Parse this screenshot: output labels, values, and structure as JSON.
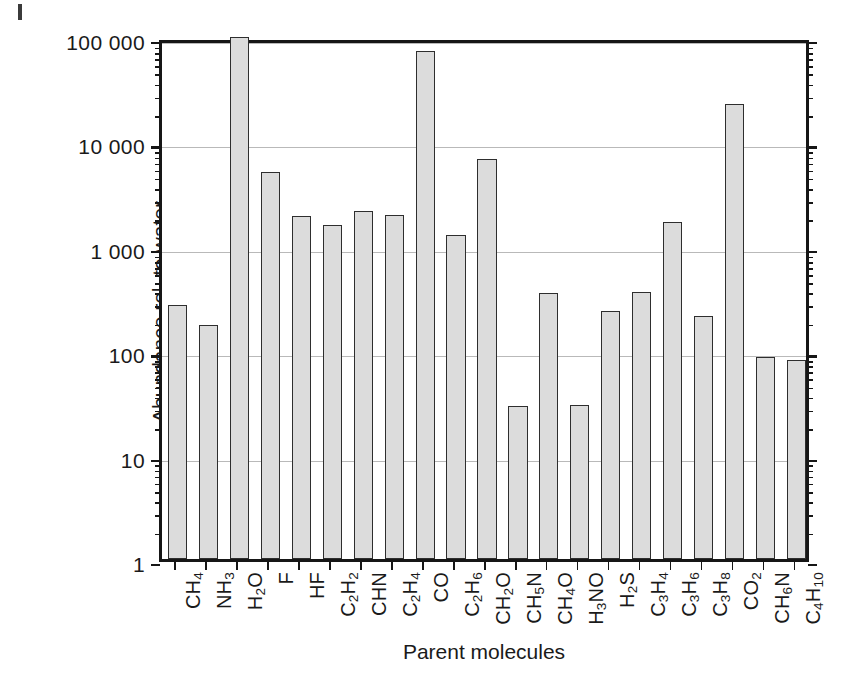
{
  "chart_data": {
    "type": "bar",
    "title": "",
    "xlabel": "Parent molecules",
    "ylabel": "Abundance rel. to water",
    "yscale": "log",
    "ylim": [
      1,
      100000
    ],
    "ytick_labels": [
      "1",
      "10",
      "100",
      "1 000",
      "10 000",
      "100 000"
    ],
    "ytick_values": [
      1,
      10,
      100,
      1000,
      10000,
      100000
    ],
    "grid": true,
    "legend": "none",
    "categories": [
      "CH4",
      "NH3",
      "H2O",
      "F",
      "HF",
      "C2H2",
      "CHN",
      "C2H4",
      "CO",
      "C2H6",
      "CH2O",
      "CH5N",
      "CH4O",
      "H3NO",
      "H2S",
      "C3H4",
      "C3H6",
      "C3H8",
      "CO2",
      "CH6N",
      "C4H10"
    ],
    "categories_html": [
      "CH<sub>4</sub>",
      "NH<sub>3</sub>",
      "H<sub>2</sub>O",
      "F",
      "HF",
      "C<sub>2</sub>H<sub>2</sub>",
      "CHN",
      "C<sub>2</sub>H<sub>4</sub>",
      "CO",
      "C<sub>2</sub>H<sub>6</sub>",
      "CH<sub>2</sub>O",
      "CH<sub>5</sub>N",
      "CH<sub>4</sub>O",
      "H<sub>3</sub>NO",
      "H<sub>2</sub>S",
      "C<sub>3</sub>H<sub>4</sub>",
      "C<sub>3</sub>H<sub>6</sub>",
      "C<sub>3</sub>H<sub>8</sub>",
      "CO<sub>2</sub>",
      "CH<sub>6</sub>N",
      "C<sub>4</sub>H<sub>10</sub>"
    ],
    "values": [
      270,
      175,
      100000,
      5100,
      1950,
      1600,
      2150,
      1980,
      73000,
      1260,
      6800,
      29,
      350,
      30,
      240,
      360,
      1700,
      215,
      23000,
      86,
      81
    ],
    "bar_fill_color": "#dcdcdc",
    "bar_edge_color": "#2e2e2e",
    "axis_color": "#161616",
    "gridline_color": "#b9b9b9"
  }
}
